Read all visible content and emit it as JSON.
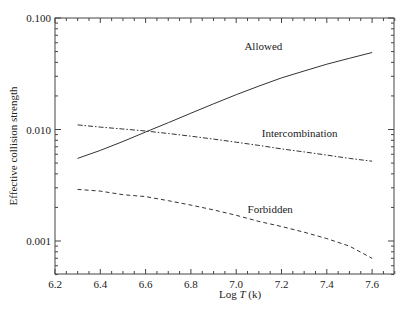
{
  "chart_data": {
    "type": "line",
    "title": "",
    "xlabel": "Log T (k)",
    "xlabel_parts": {
      "prefix": "Log ",
      "italic": "T",
      "suffix": " (k)"
    },
    "ylabel": "Effective collision strength",
    "yscale": "log",
    "xlim": [
      6.2,
      7.7
    ],
    "ylim": [
      0.0005,
      0.1
    ],
    "grid": false,
    "legend": "inline labels",
    "x_ticks": [
      "6.2",
      "6.4",
      "6.6",
      "6.8",
      "7.0",
      "7.2",
      "7.4",
      "7.6"
    ],
    "y_ticks": [
      "0.100",
      "0.010",
      "0.001"
    ],
    "x": [
      6.3,
      6.4,
      6.5,
      6.6,
      6.7,
      6.8,
      6.9,
      7.0,
      7.1,
      7.2,
      7.3,
      7.4,
      7.5,
      7.6
    ],
    "series": [
      {
        "name": "Allowed",
        "style": "solid",
        "values": [
          0.0055,
          0.0065,
          0.0078,
          0.0095,
          0.0115,
          0.014,
          0.017,
          0.0205,
          0.0245,
          0.029,
          0.0335,
          0.0385,
          0.0435,
          0.049
        ]
      },
      {
        "name": "Intercombination",
        "style": "dash-dot",
        "values": [
          0.011,
          0.0105,
          0.0101,
          0.0097,
          0.0092,
          0.0087,
          0.0082,
          0.0077,
          0.0072,
          0.0067,
          0.0063,
          0.0059,
          0.0055,
          0.0052
        ]
      },
      {
        "name": "Forbidden",
        "style": "dashed",
        "values": [
          0.0029,
          0.0028,
          0.0026,
          0.0025,
          0.0023,
          0.0021,
          0.0019,
          0.0017,
          0.0015,
          0.00135,
          0.0012,
          0.00105,
          0.0009,
          0.0007
        ]
      }
    ],
    "annotations": [
      {
        "text": "Allowed",
        "x": 7.12,
        "y": 0.052
      },
      {
        "text": "Intercombination",
        "x": 7.28,
        "y": 0.0085
      },
      {
        "text": "Forbidden",
        "x": 7.15,
        "y": 0.0018
      }
    ]
  }
}
